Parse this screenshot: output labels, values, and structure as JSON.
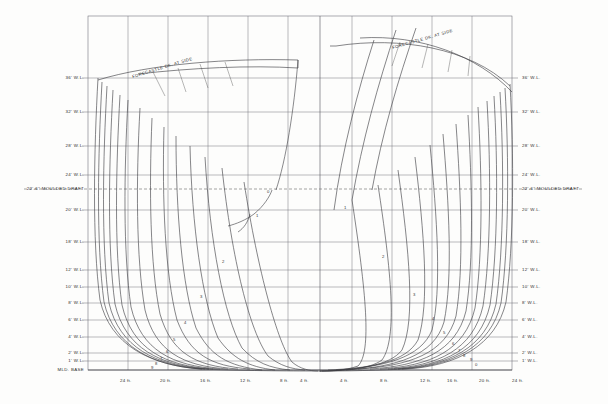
{
  "drawing": {
    "title": "Body Plan - Lines Drawing",
    "type": "naval-architecture-body-plan"
  },
  "waterlines_left": [
    {
      "label": "36' W.L.",
      "y": 78
    },
    {
      "label": "32' W.L.",
      "y": 112
    },
    {
      "label": "28' W.L.",
      "y": 146
    },
    {
      "label": "24' W.L.",
      "y": 175
    },
    {
      "label": "22'-6\" MOULDED DRAFT",
      "y": 189,
      "dashed": true
    },
    {
      "label": "20' W.L.",
      "y": 210
    },
    {
      "label": "18' W.L.",
      "y": 242
    },
    {
      "label": "12' W.L.",
      "y": 270
    },
    {
      "label": "10' W.L.",
      "y": 287
    },
    {
      "label": "8' W.L.",
      "y": 303
    },
    {
      "label": "6' W.L.",
      "y": 320
    },
    {
      "label": "4' W.L.",
      "y": 337
    },
    {
      "label": "2' W.L.",
      "y": 353
    },
    {
      "label": "1' W.L.",
      "y": 361
    },
    {
      "label": "MLD. BASE",
      "y": 370
    }
  ],
  "waterlines_right": [
    {
      "label": "36' W.L.",
      "y": 78
    },
    {
      "label": "32' W.L.",
      "y": 112
    },
    {
      "label": "28' W.L.",
      "y": 146
    },
    {
      "label": "24' W.L.",
      "y": 175
    },
    {
      "label": "22'-6\" MOULDED DRAFT",
      "y": 189
    },
    {
      "label": "20' W.L.",
      "y": 210
    },
    {
      "label": "18' W.L.",
      "y": 242
    },
    {
      "label": "12' W.L.",
      "y": 270
    },
    {
      "label": "10' W.L.",
      "y": 287
    },
    {
      "label": "8' W.L.",
      "y": 303
    },
    {
      "label": "6' W.L.",
      "y": 320
    },
    {
      "label": "4' W.L.",
      "y": 337
    },
    {
      "label": "2' W.L.",
      "y": 353
    },
    {
      "label": "1' W.L.",
      "y": 361
    }
  ],
  "stations_bottom": [
    {
      "label": "24 ft.",
      "x": 128
    },
    {
      "label": "20 ft.",
      "x": 168
    },
    {
      "label": "16 ft.",
      "x": 208
    },
    {
      "label": "12 ft.",
      "x": 248
    },
    {
      "label": "8 ft.",
      "x": 288
    },
    {
      "label": "4 ft.",
      "x": 308
    },
    {
      "label": "4 ft.",
      "x": 348
    },
    {
      "label": "8 ft.",
      "x": 388
    },
    {
      "label": "12 ft.",
      "x": 428
    },
    {
      "label": "16 ft.",
      "x": 455
    },
    {
      "label": "20 ft.",
      "x": 487
    },
    {
      "label": "24 ft.",
      "x": 520
    }
  ],
  "deck_labels": [
    {
      "text": "FORECASTLE DK. AT SIDE",
      "x": 133,
      "y": 74,
      "rotate": -17
    },
    {
      "text": "FORECASTLE DK. AT SIDE",
      "x": 393,
      "y": 45,
      "rotate": -16
    }
  ],
  "curve_numbers_left": [
    {
      "n": "0",
      "x": 267,
      "y": 189
    },
    {
      "n": "1",
      "x": 256,
      "y": 213
    },
    {
      "n": "2",
      "x": 222,
      "y": 259
    },
    {
      "n": "3",
      "x": 200,
      "y": 294
    },
    {
      "n": "4",
      "x": 184,
      "y": 320
    },
    {
      "n": "5",
      "x": 173,
      "y": 337
    },
    {
      "n": "6",
      "x": 166,
      "y": 349
    },
    {
      "n": "7",
      "x": 160,
      "y": 356
    },
    {
      "n": "8",
      "x": 155,
      "y": 361
    },
    {
      "n": "9",
      "x": 151,
      "y": 365
    }
  ],
  "curve_numbers_right": [
    {
      "n": "1",
      "x": 344,
      "y": 205
    },
    {
      "n": "2",
      "x": 382,
      "y": 254
    },
    {
      "n": "3",
      "x": 413,
      "y": 292
    },
    {
      "n": "4",
      "x": 432,
      "y": 316
    },
    {
      "n": "5",
      "x": 443,
      "y": 330
    },
    {
      "n": "6",
      "x": 452,
      "y": 341
    },
    {
      "n": "7",
      "x": 458,
      "y": 348
    },
    {
      "n": "8",
      "x": 463,
      "y": 353
    },
    {
      "n": "9",
      "x": 470,
      "y": 357
    },
    {
      "n": "0",
      "x": 475,
      "y": 362
    }
  ],
  "colors": {
    "ink": "#2b2b2b",
    "grid": "#6a6a72",
    "hull": "#3a3a3f",
    "paper": "#fdfdfc"
  }
}
